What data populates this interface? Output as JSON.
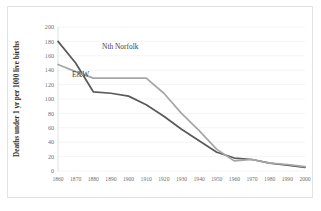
{
  "chart_data": {
    "type": "line",
    "title": "",
    "xlabel": "",
    "ylabel": "Deaths under 1 yr per 1000 live births",
    "x": [
      1860,
      1870,
      1880,
      1890,
      1900,
      1910,
      1920,
      1930,
      1940,
      1950,
      1960,
      1970,
      1980,
      1990,
      2000
    ],
    "xticklabels": [
      "1860",
      "1870",
      "1880",
      "1890",
      "1900",
      "1910",
      "1920",
      "1930",
      "1940",
      "1950",
      "1960",
      "1970",
      "1980",
      "1990",
      "2000"
    ],
    "yticklabels": [
      "0",
      "20",
      "40",
      "60",
      "80",
      "100",
      "120",
      "140",
      "160",
      "180",
      "200"
    ],
    "ylim": [
      0,
      200
    ],
    "ytick_step": 20,
    "xlim": [
      1860,
      2000
    ],
    "grid": "horizontal",
    "legend_position": "inline-annotations",
    "series": [
      {
        "name": "E&W",
        "label": "E&W",
        "color": "#595959",
        "values": [
          180,
          150,
          110,
          108,
          104,
          92,
          76,
          58,
          42,
          26,
          18,
          16,
          11,
          8,
          5
        ]
      },
      {
        "name": "Nth Norfolk",
        "label": "Nth Norfolk",
        "color": "#a6a6a6",
        "values": [
          148,
          138,
          129,
          129,
          129,
          129,
          108,
          80,
          56,
          30,
          14,
          16,
          11,
          9,
          6
        ]
      }
    ],
    "annotations": [
      {
        "text": "Nth Norfolk",
        "x": 1885,
        "y": 170
      },
      {
        "text": "E&W",
        "x": 1868,
        "y": 131
      }
    ]
  },
  "frame": {
    "border_color": "#e2e2e2",
    "background": "#ffffff"
  }
}
